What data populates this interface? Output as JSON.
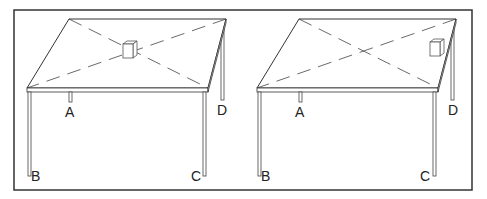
{
  "diagram": {
    "panels": [
      {
        "id": "left",
        "cube_position": "center of tabletop",
        "legs": {
          "A": "A",
          "B": "B",
          "C": "C",
          "D": "D"
        }
      },
      {
        "id": "right",
        "cube_position": "near corner D",
        "legs": {
          "A": "A",
          "B": "B",
          "C": "C",
          "D": "D"
        }
      }
    ],
    "colors": {
      "line": "#333333",
      "background": "#ffffff"
    }
  }
}
